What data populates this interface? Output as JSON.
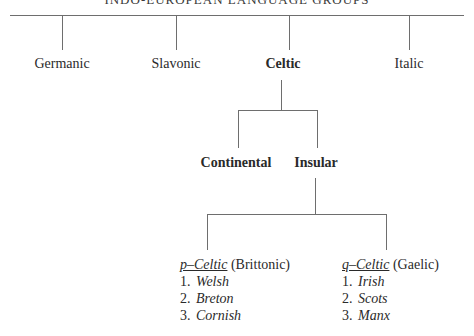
{
  "title": "INDO-EUROPEAN LANGUAGE GROUPS",
  "top_level": [
    {
      "label": "Germanic",
      "bold": false
    },
    {
      "label": "Slavonic",
      "bold": false
    },
    {
      "label": "Celtic",
      "bold": true
    },
    {
      "label": "Italic",
      "bold": false
    }
  ],
  "celtic_branches": [
    {
      "label": "Continental"
    },
    {
      "label": "Insular"
    }
  ],
  "insular_groups": [
    {
      "name": "p–Celtic",
      "alt": "(Brittonic)",
      "languages": [
        {
          "num": "1.",
          "name": "Welsh"
        },
        {
          "num": "2.",
          "name": "Breton"
        },
        {
          "num": "3.",
          "name": "Cornish"
        }
      ]
    },
    {
      "name": "q–Celtic",
      "alt": "(Gaelic)",
      "languages": [
        {
          "num": "1.",
          "name": "Irish"
        },
        {
          "num": "2.",
          "name": "Scots"
        },
        {
          "num": "3.",
          "name": "Manx"
        }
      ]
    }
  ]
}
